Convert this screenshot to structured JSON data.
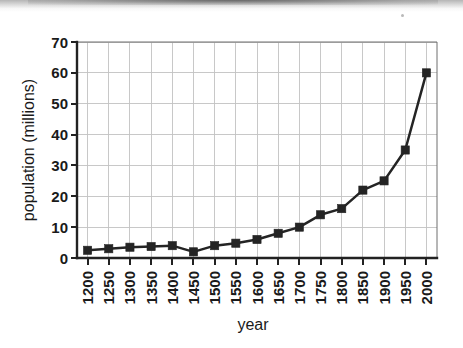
{
  "page": {
    "background_color": "#ffffff",
    "ink_color": "#242424",
    "grid_color": "#c2c2c2"
  },
  "artifacts": {
    "scan_shadow_label": "scan-shadow-band",
    "speck_label": "scan-speck"
  },
  "chart_data": {
    "type": "line",
    "title": "",
    "subtitle": "",
    "xlabel": "year",
    "ylabel": "population (millions)",
    "categories": [
      1200,
      1250,
      1300,
      1350,
      1400,
      1450,
      1500,
      1550,
      1600,
      1650,
      1700,
      1750,
      1800,
      1850,
      1900,
      1950,
      2000
    ],
    "x_tick_labels": [
      "1200",
      "1250",
      "1300",
      "1350",
      "1400",
      "1450",
      "1500",
      "1550",
      "1600",
      "1650",
      "1700",
      "1750",
      "1800",
      "1850",
      "1900",
      "1950",
      "2000"
    ],
    "values": [
      2.5,
      3,
      3.5,
      3.7,
      4,
      2,
      4,
      4.8,
      6,
      8,
      10,
      14,
      16,
      22,
      25,
      35,
      60
    ],
    "y_tick_labels": [
      "0",
      "10",
      "20",
      "30",
      "40",
      "50",
      "60",
      "70"
    ],
    "y_ticks": [
      0,
      10,
      20,
      30,
      40,
      50,
      60,
      70
    ],
    "ylim": [
      0,
      70
    ],
    "xlim": [
      1175,
      2025
    ],
    "grid": "both",
    "legend": "none",
    "marker": "square",
    "series": [
      {
        "name": "population",
        "values": [
          2.5,
          3,
          3.5,
          3.7,
          4,
          2,
          4,
          4.8,
          6,
          8,
          10,
          14,
          16,
          22,
          25,
          35,
          60
        ]
      }
    ],
    "annotations": []
  }
}
